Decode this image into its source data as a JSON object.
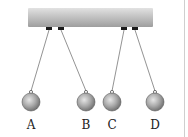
{
  "diagram": {
    "type": "pendulums-hanging-from-bar",
    "bar": {
      "x": 28,
      "y": 8,
      "width": 125,
      "height": 19,
      "color_top": "#d8d8d8",
      "color_bottom": "#a6a6a6"
    },
    "pendulums": [
      {
        "label": "A",
        "anchor": [
          49,
          28
        ],
        "ball": [
          31,
          102
        ],
        "radius": 9
      },
      {
        "label": "B",
        "anchor": [
          61,
          28
        ],
        "ball": [
          86,
          102
        ],
        "radius": 9
      },
      {
        "label": "C",
        "anchor": [
          124,
          28
        ],
        "ball": [
          112,
          102
        ],
        "radius": 9
      },
      {
        "label": "D",
        "anchor": [
          135,
          28
        ],
        "ball": [
          155,
          102
        ],
        "radius": 9
      }
    ],
    "label_y": 118
  }
}
